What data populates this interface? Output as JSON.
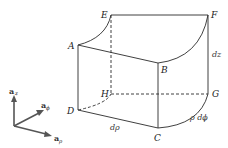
{
  "diagram": {
    "vertices": {
      "A": "A",
      "B": "B",
      "C": "C",
      "D": "D",
      "E": "E",
      "F": "F",
      "G": "G",
      "H": "H"
    },
    "dimensions": {
      "dz": "dz",
      "drho": "dρ",
      "rho_dphi": "ρ dϕ"
    },
    "axes": {
      "z": {
        "base": "a",
        "sub": "z"
      },
      "phi": {
        "base": "a",
        "sub": "ϕ"
      },
      "rho": {
        "base": "a",
        "sub": "ρ"
      }
    },
    "colors": {
      "line": "#2a2a2a",
      "axis": "#555555",
      "background": "#ffffff"
    }
  }
}
